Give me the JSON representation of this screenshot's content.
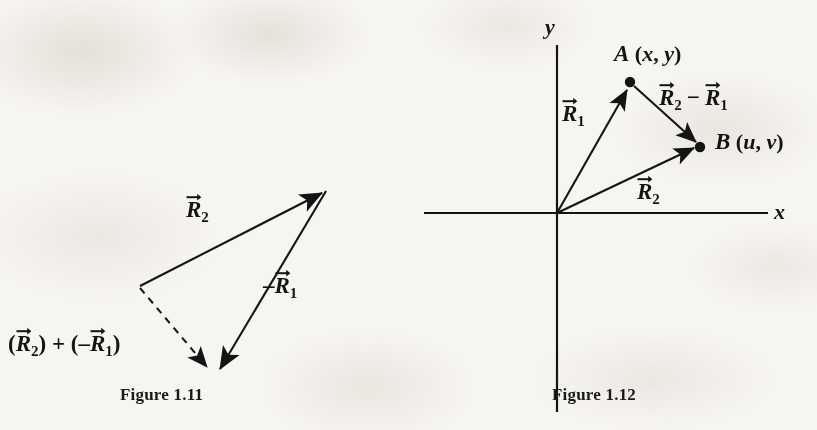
{
  "page": {
    "width": 817,
    "height": 430,
    "background": "#f7f5f1",
    "ink_color": "#141414"
  },
  "figures": [
    {
      "id": "figure-1-11",
      "caption": "Figure 1.11",
      "description": "Vector subtraction shown as a triangle: R2 added to the negative of R1 gives the resultant drawn as a dashed vector.",
      "labels": {
        "r2": {
          "letter": "R",
          "subscript": "2",
          "prefix": "",
          "text": "R⃗₂"
        },
        "neg_r1": {
          "letter": "R",
          "subscript": "1",
          "prefix": "–",
          "text": "–R⃗₁"
        },
        "resultant": {
          "text": "(R⃗₂) + (–R⃗₁)",
          "open": "(",
          "mid": ") + (",
          "close": ")",
          "minus": "–"
        }
      },
      "geometry": {
        "apex_left": [
          140,
          286
        ],
        "tip_top_right": [
          326,
          191
        ],
        "tip_bottom": [
          213,
          373
        ],
        "r2_vector": {
          "from": [
            140,
            286
          ],
          "to": [
            326,
            191
          ],
          "style": "solid",
          "arrow": "end"
        },
        "neg_r1_vector": {
          "from": [
            326,
            191
          ],
          "to": [
            219,
            374
          ],
          "style": "solid",
          "arrow": "end"
        },
        "resultant_vector": {
          "from": [
            140,
            286
          ],
          "to": [
            210,
            372
          ],
          "style": "dashed",
          "arrow": "end"
        }
      }
    },
    {
      "id": "figure-1-12",
      "caption": "Figure 1.12",
      "description": "Cartesian axes with position vectors R1 to point A and R2 to point B, and the difference vector R2 minus R1 drawn from A to B.",
      "labels": {
        "y_axis": "y",
        "x_axis": "x",
        "point_a": "A (x, y)",
        "point_b": "B (u, v)",
        "r1": {
          "letter": "R",
          "subscript": "1",
          "text": "R⃗₁"
        },
        "r2": {
          "letter": "R",
          "subscript": "2",
          "text": "R⃗₂"
        },
        "difference": {
          "text": "R⃗₂ − R⃗₁",
          "minus": "−"
        }
      },
      "geometry": {
        "origin": [
          557,
          213
        ],
        "x_axis_span": [
          424,
          770
        ],
        "y_axis_span": [
          45,
          412
        ],
        "point_a": [
          630,
          82
        ],
        "point_b": [
          700,
          147
        ],
        "r1_vector": {
          "from": [
            557,
            213
          ],
          "to": [
            628,
            86
          ],
          "arrow": "end"
        },
        "r2_vector": {
          "from": [
            557,
            213
          ],
          "to": [
            697,
            146
          ],
          "arrow": "end"
        },
        "difference_vector": {
          "from": [
            634,
            86
          ],
          "to": [
            699,
            145
          ],
          "arrow": "end"
        }
      }
    }
  ]
}
